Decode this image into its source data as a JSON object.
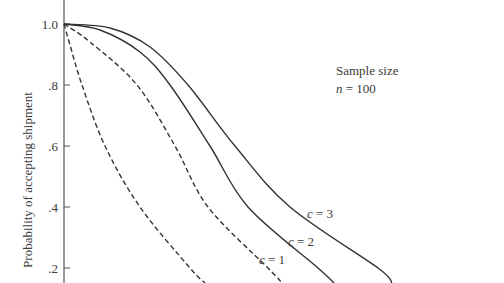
{
  "chart_data": {
    "type": "line",
    "title": "",
    "xlabel": "",
    "ylabel": "Probability of accepting shipment",
    "ylim": [
      0.15,
      1.07
    ],
    "y_ticks": [
      {
        "value": 1.0,
        "label": "1.0"
      },
      {
        "value": 0.8,
        "label": ".8"
      },
      {
        "value": 0.6,
        "label": ".6"
      },
      {
        "value": 0.4,
        "label": ".4"
      },
      {
        "value": 0.2,
        "label": ".2"
      }
    ],
    "grid": false,
    "annotation": {
      "line1": "Sample size",
      "line2": "n = 100"
    },
    "series": [
      {
        "name": "c = 0",
        "style": "dashed",
        "label_visible": false,
        "points_px": [
          [
            64,
            24
          ],
          [
            70,
            45
          ],
          [
            82,
            85
          ],
          [
            105,
            146
          ],
          [
            140,
            207
          ],
          [
            190,
            268
          ],
          [
            205,
            283
          ]
        ]
      },
      {
        "name": "c = 1",
        "style": "dashed",
        "label": "c = 1",
        "points_px": [
          [
            64,
            24
          ],
          [
            90,
            42
          ],
          [
            137,
            85
          ],
          [
            175,
            146
          ],
          [
            208,
            207
          ],
          [
            268,
            268
          ],
          [
            282,
            283
          ]
        ]
      },
      {
        "name": "c = 2",
        "style": "solid",
        "label": "c = 2",
        "points_px": [
          [
            64,
            24
          ],
          [
            100,
            30
          ],
          [
            140,
            52
          ],
          [
            170,
            85
          ],
          [
            210,
            146
          ],
          [
            248,
            207
          ],
          [
            318,
            268
          ],
          [
            334,
            283
          ]
        ]
      },
      {
        "name": "c = 3",
        "style": "solid",
        "label": "c = 3",
        "points_px": [
          [
            64,
            24
          ],
          [
            110,
            28
          ],
          [
            150,
            47
          ],
          [
            188,
            85
          ],
          [
            235,
            146
          ],
          [
            290,
            207
          ],
          [
            378,
            268
          ],
          [
            392,
            283
          ]
        ]
      }
    ]
  }
}
